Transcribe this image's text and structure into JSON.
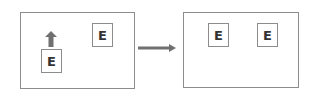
{
  "diagram": {
    "before": {
      "elements": [
        {
          "label": "E",
          "role": "static"
        },
        {
          "label": "E",
          "role": "moving",
          "motion": "up"
        }
      ]
    },
    "transition": {
      "icon": "right-arrow-icon"
    },
    "after": {
      "elements": [
        {
          "label": "E"
        },
        {
          "label": "E"
        }
      ]
    },
    "colors": {
      "border": "#8c8c8c",
      "arrow": "#707070",
      "text": "#333333"
    }
  }
}
